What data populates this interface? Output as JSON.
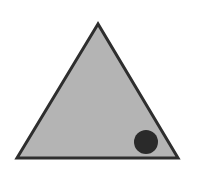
{
  "figure": {
    "width": 202,
    "height": 179,
    "background": "#ffffff",
    "triangle": {
      "points": [
        [
          98,
          24
        ],
        [
          17,
          158
        ],
        [
          178,
          158
        ]
      ],
      "fill": "#b4b4b4",
      "stroke": "#2e2e2e",
      "stroke_width": 3
    },
    "dot": {
      "cx": 146,
      "cy": 142,
      "r": 12,
      "fill": "#2a2a2a"
    }
  }
}
